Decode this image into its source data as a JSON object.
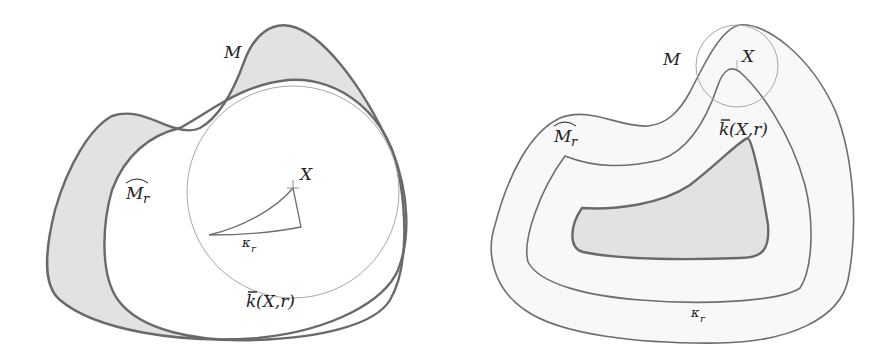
{
  "figure": {
    "left_panel": {
      "labels": {
        "M": "M",
        "M_hat_r": "M",
        "M_hat_r_sub": "r",
        "X": "X",
        "kappa_r": "κ",
        "kappa_r_sub": "r",
        "k_bar": "k",
        "k_bar_args": "(X,r)"
      },
      "regions": {
        "M_outer": "shape M (gray-shaded where outside hat M_r)",
        "M_hat_r": "white region hat M_r",
        "ball": "closed ball k̄(X,r) centered at X",
        "kappa_r": "curvilinear triangle κ_r"
      }
    },
    "right_panel": {
      "labels": {
        "M": "M",
        "M_hat_r": "M",
        "M_hat_r_sub": "r",
        "X": "X",
        "kappa_r": "κ",
        "kappa_r_sub": "r",
        "k_bar": "k",
        "k_bar_args": "(X,r)"
      },
      "regions": {
        "M_outer": "outer boundary of M",
        "M_hat_r": "middle parallel curve",
        "ball": "small ball k̄(X,r) at the tip",
        "core": "gray-shaded inner core"
      }
    },
    "colors": {
      "shade": "#e2e2e2",
      "stroke": "#6a6a6a",
      "thin_stroke": "#a8a8a8",
      "background": "#ffffff"
    }
  }
}
